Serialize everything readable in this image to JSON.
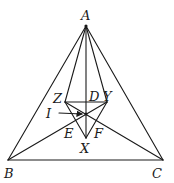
{
  "figure": {
    "type": "geometry-diagram",
    "points": {
      "A": {
        "label": "A"
      },
      "B": {
        "label": "B"
      },
      "C": {
        "label": "C"
      },
      "D": {
        "label": "D"
      },
      "E": {
        "label": "E"
      },
      "F": {
        "label": "F"
      },
      "I": {
        "label": "I"
      },
      "X": {
        "label": "X"
      },
      "Y": {
        "label": "Y"
      },
      "Z": {
        "label": "Z"
      }
    },
    "segments": [
      [
        "A",
        "B"
      ],
      [
        "B",
        "C"
      ],
      [
        "C",
        "A"
      ],
      [
        "A",
        "Z"
      ],
      [
        "A",
        "Y"
      ],
      [
        "A",
        "X"
      ],
      [
        "Z",
        "Y"
      ],
      [
        "Z",
        "X"
      ],
      [
        "Y",
        "X"
      ],
      [
        "B",
        "Y"
      ],
      [
        "C",
        "Z"
      ]
    ],
    "arrow": {
      "label": "I",
      "to": "I"
    },
    "color": "#1a1a1a"
  }
}
